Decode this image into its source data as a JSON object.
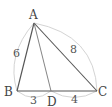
{
  "diagram": {
    "type": "triangle",
    "points": {
      "A": {
        "label": "A",
        "x": 34,
        "y": 23
      },
      "B": {
        "label": "B",
        "x": 17,
        "y": 91
      },
      "C": {
        "label": "C",
        "x": 97,
        "y": 91
      },
      "D": {
        "label": "D",
        "x": 51,
        "y": 91
      }
    },
    "segments": [
      {
        "from": "A",
        "to": "B"
      },
      {
        "from": "A",
        "to": "C"
      },
      {
        "from": "B",
        "to": "C"
      },
      {
        "from": "A",
        "to": "D"
      }
    ],
    "lengths": {
      "AB": "6",
      "AC": "8",
      "BD": "3",
      "DC": "4"
    },
    "colors": {
      "line": "#555555",
      "arc": "#cfcfcf",
      "text": "#444444"
    }
  }
}
